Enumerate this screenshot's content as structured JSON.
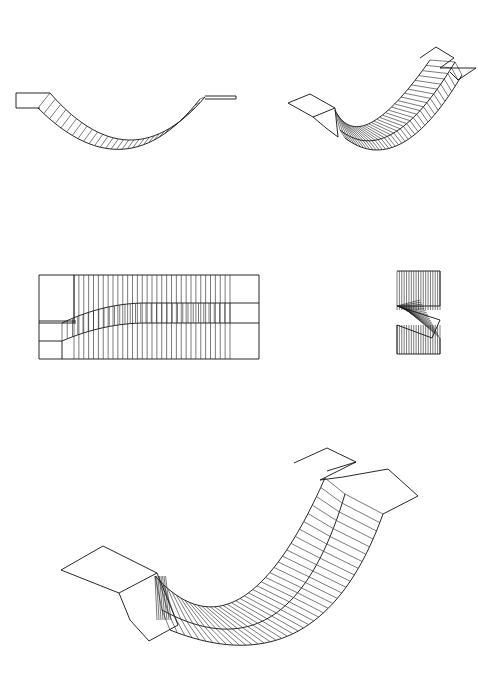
{
  "figure": {
    "ink_color": "#111111",
    "background": "#ffffff",
    "views": [
      {
        "id": "side-elevation",
        "bbox": [
          14,
          88,
          236,
          160
        ],
        "ribs": 30
      },
      {
        "id": "isometric-small",
        "bbox": [
          288,
          52,
          476,
          142
        ],
        "ribs": 36
      },
      {
        "id": "plan-view",
        "bbox": [
          39,
          275,
          259,
          359
        ],
        "ribs": 32
      },
      {
        "id": "end-view",
        "bbox": [
          397,
          271,
          440,
          354
        ],
        "ribs": 18
      },
      {
        "id": "isometric-large",
        "bbox": [
          60,
          450,
          420,
          643
        ],
        "ribs": 40
      }
    ]
  }
}
